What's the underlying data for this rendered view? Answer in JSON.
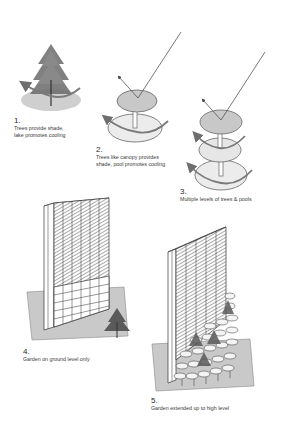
{
  "diagram": {
    "panels": [
      {
        "number": "1.",
        "text_line1": "Trees provide shade,",
        "text_line2": "lake promotes cooling"
      },
      {
        "number": "2.",
        "text_line1": "Trees like canopy provides",
        "text_line2": "shade, pool promotes cooling"
      },
      {
        "number": "3.",
        "text_line1": "Multiple levels of trees & pools",
        "text_line2": ""
      },
      {
        "number": "4.",
        "text_line1": "Garden on ground level only",
        "text_line2": ""
      },
      {
        "number": "5.",
        "text_line1": "Garden extended up to high level",
        "text_line2": ""
      }
    ],
    "colors": {
      "canopy_fill": "#c8c8c8",
      "pool_fill": "#e6e6e6",
      "lake_fill": "#cfcfcf",
      "airflow_arrow": "#7a7a7a",
      "sun_ray": "#555555",
      "ground_plane": "#c9c9c9",
      "tree": "#5a5a5a"
    }
  }
}
